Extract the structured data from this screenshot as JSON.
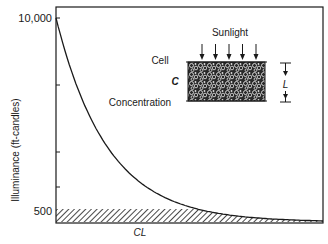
{
  "chart_data": {
    "type": "line",
    "title": "",
    "xlabel": "",
    "ylabel": "Illuminance (ft-candles)",
    "y_tick_labels": [
      "10,000",
      "500"
    ],
    "x_annotation": "CL",
    "ylim": [
      0,
      10000
    ],
    "series": [
      {
        "name": "Illuminance vs depth",
        "description": "Exponential decay of illuminance with depth into cell suspension",
        "x": [
          0,
          0.1,
          0.2,
          0.3,
          0.4,
          0.5,
          0.6,
          0.7,
          0.8,
          1.0
        ],
        "y": [
          10000,
          5500,
          3000,
          1650,
          900,
          500,
          280,
          150,
          80,
          30
        ]
      }
    ],
    "shaded_region": {
      "description": "Hatched band below 500 ft-candles",
      "y_max": 500
    },
    "grid": false
  },
  "inset": {
    "sunlight_label": "Sunlight",
    "cell_label": "Cell",
    "c_label": "C",
    "concentration_label": "Concentration",
    "l_label": "L",
    "arrow_count": 5
  },
  "colors": {
    "ink": "#1a1a1a",
    "background": "#ffffff"
  }
}
